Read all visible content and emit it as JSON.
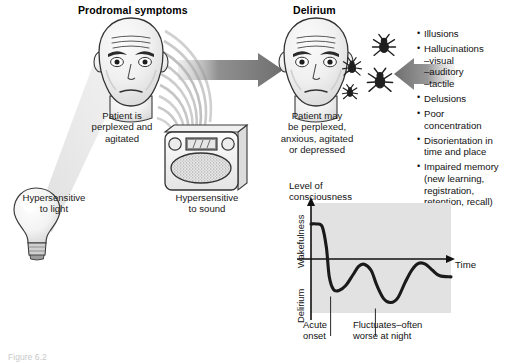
{
  "figure": {
    "number_label": "Figure 6.2",
    "headings": {
      "left": "Prodromal symptoms",
      "right": "Delirium"
    },
    "captions": {
      "patient_prodromal": "Patient is\nperplexed and\nagitated",
      "patient_delirium": "Patient may\nbe perplexed,\nanxious, agitated\nor depressed",
      "light": "Hypersensitive\nto light",
      "sound": "Hypersensitive\nto sound"
    },
    "icons": {
      "light_bulb": "light-bulb-icon",
      "radio": "radio-icon",
      "head_prodromal": "patient-head-icon",
      "head_delirium": "patient-head-icon",
      "insects": "insect-hallucination-icon",
      "arrow_progression": "arrow-right-icon",
      "arrow_symptoms": "arrow-left-icon",
      "sound_waves": "sound-wave-icon",
      "light_beam": "light-beam-icon"
    },
    "symptom_list": [
      {
        "type": "bullet",
        "text": "Illusions"
      },
      {
        "type": "bullet",
        "text": "Hallucinations"
      },
      {
        "type": "sub",
        "text": "–visual"
      },
      {
        "type": "sub",
        "text": "–auditory"
      },
      {
        "type": "sub",
        "text": "–tactile"
      },
      {
        "type": "bullet",
        "text": "Delusions"
      },
      {
        "type": "bullet",
        "text": "Poor"
      },
      {
        "type": "cont",
        "text": "concentration"
      },
      {
        "type": "bullet",
        "text": "Disorientation in"
      },
      {
        "type": "cont",
        "text": "time and place"
      },
      {
        "type": "bullet",
        "text": "Impaired memory"
      },
      {
        "type": "cont",
        "text": "(new learning,"
      },
      {
        "type": "cont",
        "text": "registration,"
      },
      {
        "type": "cont",
        "text": "retention, recall)"
      }
    ],
    "colors": {
      "arrow_gray": "#6e6e6e",
      "panel_gray": "#e2e2e2",
      "curve_black": "#1a1a1a",
      "skin_shade": "#efefef"
    }
  },
  "chart_data": {
    "type": "line",
    "title": "Level of\nconsciousness",
    "xlabel": "Time",
    "ylabel_top": "Wakefulness",
    "ylabel_bottom": "Delirium",
    "grid": false,
    "legend": "none",
    "baseline_label": "Time axis (normal level of consciousness)",
    "annotations": [
      {
        "text": "Acute\nonset",
        "points_to_x": 0.14,
        "points_to_y": -0.72
      },
      {
        "text": "Fluctuates–often\nworse at night",
        "points_to_x": 0.46,
        "points_to_y": -0.95
      }
    ],
    "x": [
      0.0,
      0.04,
      0.08,
      0.11,
      0.13,
      0.16,
      0.2,
      0.25,
      0.3,
      0.34,
      0.38,
      0.43,
      0.47,
      0.52,
      0.57,
      0.62,
      0.67,
      0.72,
      0.77,
      0.82,
      0.87,
      0.92,
      1.0
    ],
    "values": [
      0.55,
      0.55,
      0.5,
      0.1,
      -0.45,
      -0.7,
      -0.72,
      -0.62,
      -0.42,
      -0.26,
      -0.22,
      -0.34,
      -0.62,
      -0.88,
      -0.95,
      -0.86,
      -0.58,
      -0.33,
      -0.2,
      -0.22,
      -0.34,
      -0.44,
      -0.46
    ],
    "xlim": [
      0,
      1
    ],
    "ylim": [
      -1.15,
      0.95
    ]
  }
}
